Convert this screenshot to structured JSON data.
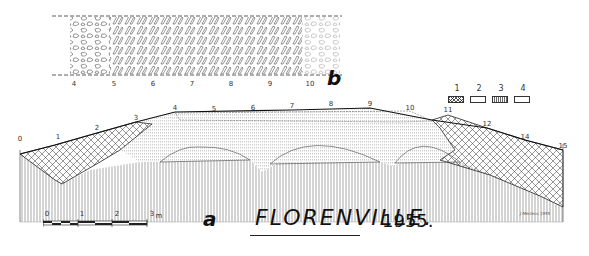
{
  "drawing": {
    "title": "FLORENVILLE.",
    "year": "1955.",
    "signature": "J.Mertens 1955",
    "panel_b_label": "b",
    "panel_a_label": "a"
  },
  "plan_b": {
    "ticks": [
      "4",
      "5",
      "6",
      "7",
      "8",
      "9",
      "10"
    ]
  },
  "section_a": {
    "ticks": [
      {
        "label": "0",
        "x": 8,
        "y": 137
      },
      {
        "label": "1",
        "x": 58,
        "y": 135
      },
      {
        "label": "2",
        "x": 97,
        "y": 126
      },
      {
        "label": "3",
        "x": 136,
        "y": 117
      },
      {
        "label": "4",
        "x": 175,
        "y": 106
      },
      {
        "label": "5",
        "x": 215,
        "y": 107
      },
      {
        "label": "6",
        "x": 253,
        "y": 106
      },
      {
        "label": "7",
        "x": 292,
        "y": 104
      },
      {
        "label": "8",
        "x": 331,
        "y": 102
      },
      {
        "label": "9",
        "x": 370,
        "y": 102
      },
      {
        "label": "10",
        "x": 410,
        "y": 106
      },
      {
        "label": "11",
        "x": 448,
        "y": 108
      },
      {
        "label": "12",
        "x": 487,
        "y": 122
      },
      {
        "label": "14",
        "x": 525,
        "y": 135
      },
      {
        "label": "15",
        "x": 563,
        "y": 144
      }
    ]
  },
  "legend": {
    "items": [
      {
        "num": "1",
        "pattern": "crosshatch"
      },
      {
        "num": "2",
        "pattern": "vertical-lines"
      },
      {
        "num": "3",
        "pattern": "vertical-dots"
      },
      {
        "num": "4",
        "pattern": "blank"
      }
    ]
  },
  "scale_bar": {
    "labels": [
      "0",
      "1",
      "2",
      "3"
    ],
    "unit": "m"
  }
}
